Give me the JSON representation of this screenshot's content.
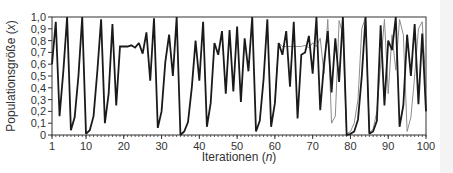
{
  "chart_data": {
    "type": "line",
    "title": "",
    "xlabel": "Iterationen (n)",
    "xlabel_main": "Iterationen (",
    "xlabel_var": "n",
    "xlabel_close": ")",
    "ylabel": "Populationsgröße (x)",
    "ylabel_main": "Populationsgröße (",
    "ylabel_var": "x",
    "ylabel_close": ")",
    "xlim": [
      1,
      100
    ],
    "ylim": [
      0,
      1.0
    ],
    "x_ticks": [
      1,
      10,
      20,
      30,
      40,
      50,
      60,
      70,
      80,
      90,
      100
    ],
    "x_tick_labels": [
      "1",
      "10",
      "20",
      "30",
      "40",
      "50",
      "60",
      "70",
      "80",
      "90",
      "100"
    ],
    "y_ticks": [
      0,
      0.1,
      0.2,
      0.3,
      0.4,
      0.5,
      0.6,
      0.7,
      0.8,
      0.9,
      1.0
    ],
    "y_tick_labels": [
      "0",
      "0,1",
      "0,2",
      "0,3",
      "0,4",
      "0,5",
      "0,6",
      "0,7",
      "0,8",
      "0,9",
      "1,0"
    ],
    "grid": false,
    "legend": null,
    "series": [
      {
        "name": "Trajektorie A",
        "color": "#1a1a1a",
        "width": 1.8,
        "x": [
          1,
          2,
          3,
          4,
          5,
          6,
          7,
          8,
          9,
          10,
          11,
          12,
          13,
          14,
          15,
          16,
          17,
          18,
          19,
          20,
          21,
          22,
          23,
          24,
          25,
          26,
          27,
          28,
          29,
          30,
          31,
          32,
          33,
          34,
          35,
          36,
          37,
          38,
          39,
          40,
          41,
          42,
          43,
          44,
          45,
          46,
          47,
          48,
          49,
          50,
          51,
          52,
          53,
          54,
          55,
          56,
          57,
          58,
          59,
          60,
          61,
          62,
          63,
          64,
          65,
          66,
          67,
          68,
          69,
          70,
          71,
          72,
          73,
          74,
          75,
          76,
          77,
          78,
          79,
          80,
          81,
          82,
          83,
          84,
          85,
          86,
          87,
          88,
          89,
          90,
          91,
          92,
          93,
          94,
          95,
          96,
          97,
          98,
          99,
          100
        ],
        "values": [
          0.6,
          0.96,
          0.16,
          0.54,
          1.0,
          0.04,
          0.15,
          0.5,
          1.0,
          0.01,
          0.04,
          0.16,
          0.54,
          0.98,
          0.1,
          0.35,
          0.94,
          0.25,
          0.75,
          0.75,
          0.75,
          0.76,
          0.74,
          0.78,
          0.69,
          0.87,
          0.46,
          0.99,
          0.06,
          0.2,
          0.62,
          0.85,
          0.5,
          1.0,
          0.0,
          0.03,
          0.11,
          0.4,
          0.8,
          0.46,
          0.96,
          0.07,
          0.27,
          0.78,
          0.68,
          0.88,
          0.35,
          0.89,
          0.37,
          0.92,
          0.28,
          0.82,
          0.54,
          1.0,
          0.03,
          0.12,
          0.47,
          0.98,
          0.07,
          0.27,
          0.78,
          0.68,
          0.88,
          0.41,
          0.96,
          0.14,
          0.68,
          0.7,
          0.84,
          0.52,
          1.0,
          0.21,
          0.6,
          0.88,
          0.36,
          0.82,
          0.45,
          1.0,
          0.0,
          0.01,
          0.03,
          0.13,
          0.5,
          1.0,
          0.01,
          0.03,
          0.12,
          0.93,
          0.25,
          0.8,
          0.72,
          1.0,
          0.07,
          0.25,
          0.85,
          0.5,
          0.94,
          0.26,
          0.86,
          0.2
        ]
      },
      {
        "name": "Trajektorie B",
        "color": "#8c8c8c",
        "width": 1.0,
        "x": [
          60,
          61,
          62,
          63,
          64,
          65,
          66,
          67,
          68,
          69,
          70,
          71,
          72,
          73,
          74,
          75,
          76,
          77,
          78,
          79,
          80,
          81,
          82,
          83,
          84,
          85,
          86,
          87,
          88,
          89,
          90,
          91,
          92,
          93,
          94,
          95,
          96,
          97,
          98,
          99,
          100
        ],
        "values": [
          0.27,
          0.78,
          0.75,
          0.75,
          0.75,
          0.75,
          0.75,
          0.75,
          0.76,
          0.74,
          0.78,
          0.75,
          0.82,
          0.52,
          0.98,
          0.1,
          0.16,
          0.97,
          0.85,
          0.01,
          0.03,
          0.1,
          0.3,
          0.9,
          1.0,
          0.02,
          0.05,
          0.2,
          0.6,
          0.98,
          0.35,
          0.85,
          0.55,
          0.98,
          0.85,
          0.03,
          0.15,
          0.5,
          0.9,
          0.96,
          0.4
        ]
      }
    ]
  }
}
